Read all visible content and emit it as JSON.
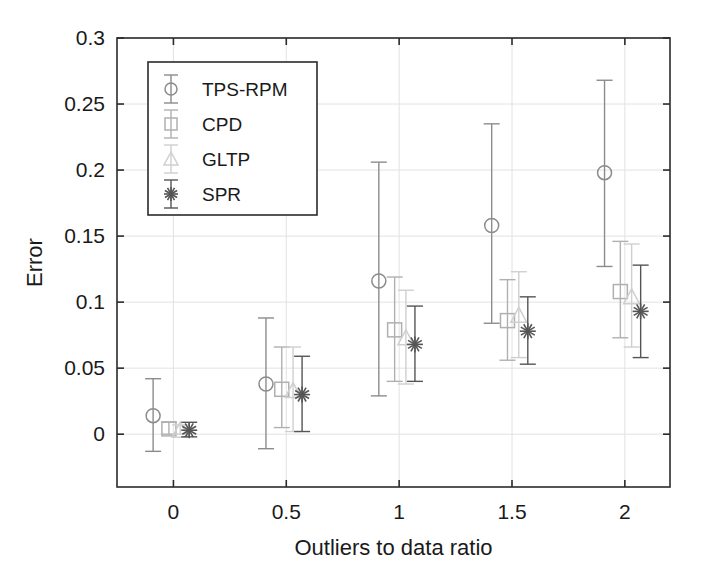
{
  "chart_data": {
    "type": "scatter",
    "title": "",
    "xlabel": "Outliers to data ratio",
    "ylabel": "Error",
    "xlim": [
      -0.25,
      2.2
    ],
    "ylim": [
      -0.04,
      0.3
    ],
    "xticks": [
      "0",
      "0.5",
      "1",
      "1.5",
      "2"
    ],
    "xtick_values": [
      0,
      0.5,
      1,
      1.5,
      2
    ],
    "yticks": [
      "0",
      "0.05",
      "0.1",
      "0.15",
      "0.2",
      "0.25",
      "0.3"
    ],
    "ytick_values": [
      0,
      0.05,
      0.1,
      0.15,
      0.2,
      0.25,
      0.3
    ],
    "grid": true,
    "legend_position": "upper-left",
    "errorbars": true,
    "categories": [
      0,
      0.5,
      1,
      1.5,
      2
    ],
    "series": [
      {
        "name": "TPS-RPM",
        "marker": "circle",
        "color": "#8c8c8c",
        "x": [
          -0.09,
          0.41,
          0.91,
          1.41,
          1.91
        ],
        "values": [
          0.014,
          0.038,
          0.116,
          0.158,
          0.198
        ],
        "err_low": [
          0.027,
          0.049,
          0.087,
          0.074,
          0.071
        ],
        "err_high": [
          0.028,
          0.05,
          0.09,
          0.077,
          0.07
        ]
      },
      {
        "name": "CPD",
        "marker": "square",
        "color": "#b0b0b0",
        "x": [
          -0.02,
          0.48,
          0.98,
          1.48,
          1.98
        ],
        "values": [
          0.004,
          0.034,
          0.079,
          0.086,
          0.108
        ],
        "err_low": [
          0.004,
          0.029,
          0.039,
          0.03,
          0.035
        ],
        "err_high": [
          0.005,
          0.032,
          0.04,
          0.031,
          0.038
        ]
      },
      {
        "name": "GLTP",
        "marker": "triangle",
        "color": "#cfcfcf",
        "x": [
          0.03,
          0.53,
          1.03,
          1.53,
          2.03
        ],
        "values": [
          0.003,
          0.033,
          0.073,
          0.09,
          0.104
        ],
        "err_low": [
          0.003,
          0.031,
          0.035,
          0.032,
          0.038
        ],
        "err_high": [
          0.004,
          0.033,
          0.036,
          0.033,
          0.04
        ]
      },
      {
        "name": "SPR",
        "marker": "asterisk",
        "color": "#555555",
        "x": [
          0.07,
          0.57,
          1.07,
          1.57,
          2.07
        ],
        "values": [
          0.003,
          0.03,
          0.068,
          0.078,
          0.093
        ],
        "err_low": [
          0.005,
          0.028,
          0.028,
          0.025,
          0.035
        ],
        "err_high": [
          0.006,
          0.029,
          0.029,
          0.026,
          0.035
        ]
      }
    ],
    "legend": [
      {
        "label": "TPS-RPM",
        "marker": "circle",
        "color": "#8c8c8c"
      },
      {
        "label": "CPD",
        "marker": "square",
        "color": "#b0b0b0"
      },
      {
        "label": "GLTP",
        "marker": "triangle",
        "color": "#cfcfcf"
      },
      {
        "label": "SPR",
        "marker": "asterisk",
        "color": "#555555"
      }
    ]
  },
  "colors": {
    "axis": "#2b2b2b",
    "grid": "#e2e2e2",
    "background": "#ffffff",
    "text": "#1a1a1a"
  }
}
